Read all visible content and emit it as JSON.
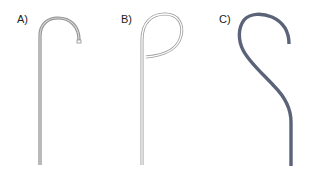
{
  "figure": {
    "panels": [
      {
        "id": "A",
        "label": "A)",
        "description": "Straight shaft with simple J-shaped hook curving to the right, thin gray tube"
      },
      {
        "id": "B",
        "label": "B)",
        "description": "Straight shaft with near-closed loop (pigtail) curling back toward the shaft, thin outlined tube"
      },
      {
        "id": "C",
        "label": "C)",
        "description": "Straight lower shaft with S-shaped angled curve and hook at top, thick dark blue-gray tube"
      }
    ],
    "colors": {
      "tube_a": "#9a9a9a",
      "tube_b_outline": "#a8a8a8",
      "tube_c": "#5b6379",
      "label": "#222222"
    }
  }
}
